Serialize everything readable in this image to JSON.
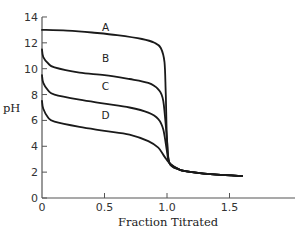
{
  "chart_data": {
    "type": "line",
    "title": "",
    "xlabel": "Fraction Titrated",
    "ylabel": "pH",
    "xlim": [
      0,
      2.0
    ],
    "ylim": [
      0,
      14
    ],
    "grid": false,
    "legend": "inline curve labels",
    "x_ticks": [
      0,
      0.5,
      1.0,
      1.5
    ],
    "x_tick_labels": [
      "0",
      "0.5",
      "1.0",
      "1.5"
    ],
    "y_ticks": [
      0,
      2,
      4,
      6,
      8,
      10,
      12,
      14
    ],
    "y_tick_labels": [
      "0",
      "2",
      "4",
      "6",
      "8",
      "10",
      "12",
      "14"
    ],
    "series": [
      {
        "name": "A",
        "label_at": [
          0.5,
          13.0
        ],
        "points": [
          [
            0,
            13.0
          ],
          [
            0.2,
            12.95
          ],
          [
            0.4,
            12.8
          ],
          [
            0.6,
            12.6
          ],
          [
            0.8,
            12.3
          ],
          [
            0.9,
            12.0
          ],
          [
            0.95,
            11.6
          ],
          [
            0.98,
            10.5
          ],
          [
            0.99,
            8.0
          ],
          [
            1.0,
            4.5
          ],
          [
            1.02,
            2.7
          ],
          [
            1.1,
            2.2
          ],
          [
            1.2,
            2.0
          ],
          [
            1.4,
            1.8
          ],
          [
            1.6,
            1.7
          ]
        ]
      },
      {
        "name": "B",
        "label_at": [
          0.5,
          10.6
        ],
        "points": [
          [
            0,
            11.5
          ],
          [
            0.01,
            10.9
          ],
          [
            0.05,
            10.4
          ],
          [
            0.1,
            10.1
          ],
          [
            0.3,
            9.7
          ],
          [
            0.5,
            9.5
          ],
          [
            0.7,
            9.2
          ],
          [
            0.85,
            8.9
          ],
          [
            0.93,
            8.4
          ],
          [
            0.97,
            7.5
          ],
          [
            1.0,
            4.5
          ],
          [
            1.02,
            2.7
          ],
          [
            1.1,
            2.2
          ],
          [
            1.2,
            2.0
          ],
          [
            1.4,
            1.8
          ],
          [
            1.6,
            1.7
          ]
        ]
      },
      {
        "name": "C",
        "label_at": [
          0.5,
          8.4
        ],
        "points": [
          [
            0,
            9.5
          ],
          [
            0.01,
            8.9
          ],
          [
            0.05,
            8.3
          ],
          [
            0.1,
            8.0
          ],
          [
            0.3,
            7.6
          ],
          [
            0.5,
            7.3
          ],
          [
            0.7,
            7.0
          ],
          [
            0.85,
            6.6
          ],
          [
            0.93,
            6.1
          ],
          [
            0.97,
            5.3
          ],
          [
            1.0,
            3.6
          ],
          [
            1.02,
            2.7
          ],
          [
            1.1,
            2.2
          ],
          [
            1.2,
            2.0
          ],
          [
            1.4,
            1.8
          ],
          [
            1.6,
            1.7
          ]
        ]
      },
      {
        "name": "D",
        "label_at": [
          0.5,
          6.2
        ],
        "points": [
          [
            0,
            7.5
          ],
          [
            0.01,
            6.9
          ],
          [
            0.05,
            6.2
          ],
          [
            0.1,
            5.9
          ],
          [
            0.3,
            5.5
          ],
          [
            0.5,
            5.2
          ],
          [
            0.7,
            4.9
          ],
          [
            0.85,
            4.4
          ],
          [
            0.93,
            3.9
          ],
          [
            0.98,
            3.2
          ],
          [
            1.02,
            2.7
          ],
          [
            1.1,
            2.2
          ],
          [
            1.2,
            2.0
          ],
          [
            1.4,
            1.8
          ],
          [
            1.6,
            1.7
          ]
        ]
      }
    ]
  },
  "axes": {
    "xlabel": "Fraction Titrated",
    "ylabel": "pH"
  }
}
